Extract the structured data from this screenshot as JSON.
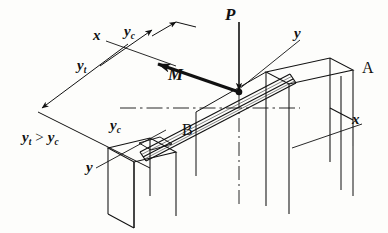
{
  "figure": {
    "kind": "engineering-mechanics-diagram"
  },
  "labels": {
    "load_force": "P",
    "moment": "M",
    "axis_x_left": "x",
    "axis_x_right": "x",
    "axis_y_right": "y",
    "axis_y_left": "y",
    "distance_tension": "y",
    "distance_tension_sub": "t",
    "distance_compression": "y",
    "distance_compression_sub": "c",
    "support_a": "A",
    "support_b": "B",
    "inequality_lhs": "y",
    "inequality_lhs_sub": "t",
    "inequality_op": ">",
    "inequality_rhs": "y",
    "inequality_rhs_sub": "c"
  },
  "colors": {
    "ink": "#111111",
    "paper": "#fdfdfb",
    "thin_line": "#1a1a1a"
  },
  "geometry": {
    "load_point": {
      "x": 239,
      "y": 92
    },
    "beam_start": {
      "x": 128,
      "y": 148
    },
    "beam_end": {
      "x": 284,
      "y": 70
    },
    "support_a_top": {
      "x": 284,
      "y": 70
    },
    "support_b_top": {
      "x": 128,
      "y": 148
    }
  }
}
